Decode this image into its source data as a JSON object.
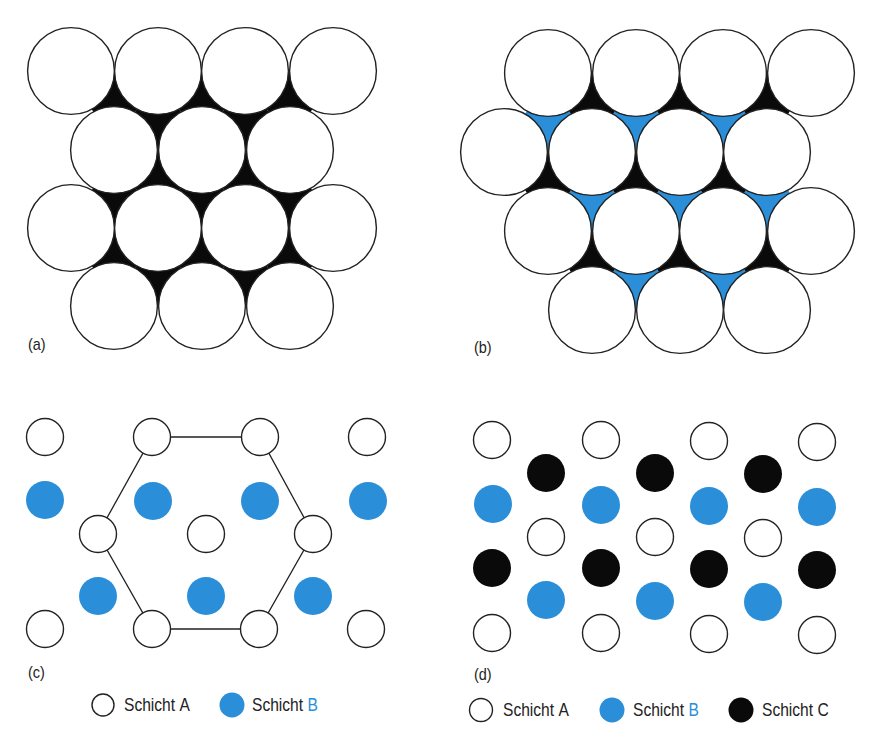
{
  "colors": {
    "blue": "#2a8fd8",
    "black": "#0a0a0a",
    "outline": "#222222",
    "white": "#ffffff"
  },
  "panels": {
    "a": {
      "label": "(a)",
      "description": "single close-packed layer of spheres (Schicht A) with black voids",
      "radius": 44,
      "rows": [
        {
          "y": 71,
          "x": [
            71,
            158,
            245,
            333
          ]
        },
        {
          "y": 150,
          "x": [
            114,
            202,
            290
          ]
        },
        {
          "y": 228,
          "x": [
            71,
            158,
            245,
            333
          ]
        },
        {
          "y": 306,
          "x": [
            114,
            202,
            290
          ]
        }
      ]
    },
    "b": {
      "label": "(b)",
      "description": "close-packed layer with two void types: black (up) and blue (down)",
      "radius": 44,
      "rows": [
        {
          "y": 73,
          "x": [
            548,
            636,
            723,
            811
          ]
        },
        {
          "y": 152,
          "x": [
            504,
            592,
            680,
            767
          ]
        },
        {
          "y": 231,
          "x": [
            548,
            636,
            723,
            811
          ]
        },
        {
          "y": 310,
          "x": [
            592,
            680,
            767
          ]
        }
      ]
    },
    "c": {
      "label": "(c)",
      "description": "ABAB stacking (hexagonal) projection with hexagon outline",
      "radius": 18.5,
      "white": [
        [
          45,
          437
        ],
        [
          152,
          437
        ],
        [
          260,
          437
        ],
        [
          367,
          437
        ],
        [
          98,
          534
        ],
        [
          206,
          534
        ],
        [
          313,
          534
        ],
        [
          45,
          629
        ],
        [
          152,
          629
        ],
        [
          259,
          629
        ],
        [
          366,
          629
        ]
      ],
      "blue": [
        [
          45,
          500
        ],
        [
          153,
          501
        ],
        [
          260,
          501
        ],
        [
          368,
          501
        ],
        [
          98,
          596
        ],
        [
          206,
          596
        ],
        [
          313,
          596
        ]
      ],
      "hexagon": [
        [
          152,
          437
        ],
        [
          260,
          437
        ],
        [
          313,
          534
        ],
        [
          259,
          629
        ],
        [
          152,
          629
        ],
        [
          98,
          534
        ]
      ],
      "legend": [
        {
          "type": "white",
          "text": "Schicht ",
          "highlight": "A",
          "highlight_colored": false
        },
        {
          "type": "blue",
          "text": "Schicht ",
          "highlight": "B",
          "highlight_colored": true
        }
      ]
    },
    "d": {
      "label": "(d)",
      "description": "ABCABC stacking (cubic) projection",
      "radius": 18.5,
      "white": [
        [
          492,
          440
        ],
        [
          601,
          440
        ],
        [
          709,
          441
        ],
        [
          817,
          442
        ],
        [
          546,
          537
        ],
        [
          655,
          537
        ],
        [
          763,
          538
        ],
        [
          492,
          633
        ],
        [
          601,
          633
        ],
        [
          709,
          634
        ],
        [
          817,
          635
        ]
      ],
      "black": [
        [
          546,
          473
        ],
        [
          655,
          473
        ],
        [
          763,
          474
        ],
        [
          492,
          568
        ],
        [
          601,
          568
        ],
        [
          709,
          569
        ],
        [
          817,
          570
        ]
      ],
      "blue": [
        [
          493,
          504
        ],
        [
          601,
          505
        ],
        [
          709,
          506
        ],
        [
          817,
          507
        ],
        [
          546,
          600
        ],
        [
          655,
          601
        ],
        [
          763,
          602
        ]
      ],
      "legend": [
        {
          "type": "white",
          "text": "Schicht ",
          "highlight": "A",
          "highlight_colored": false
        },
        {
          "type": "blue",
          "text": "Schicht ",
          "highlight": "B",
          "highlight_colored": true
        },
        {
          "type": "black",
          "text": "Schicht ",
          "highlight": "C",
          "highlight_colored": false
        }
      ]
    }
  },
  "labels": {
    "a": "(a)",
    "b": "(b)",
    "c": "(c)",
    "d": "(d)"
  },
  "legend_c": {
    "a_text": "Schicht",
    "a_letter": "A",
    "b_text": "Schicht",
    "b_letter": "B"
  },
  "legend_d": {
    "a_text": "Schicht",
    "a_letter": "A",
    "b_text": "Schicht",
    "b_letter": "B",
    "c_text": "Schicht",
    "c_letter": "C"
  }
}
